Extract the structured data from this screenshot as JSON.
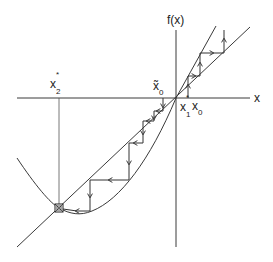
{
  "diagram": {
    "type": "cobweb-plot",
    "colors": {
      "line": "#3a3a3a",
      "background": "#ffffff"
    },
    "axes": {
      "x_label": "x",
      "y_label": "f(x)"
    },
    "labels": {
      "fixed_point_1": {
        "base": "x",
        "sup": "*",
        "sub": "1"
      },
      "fixed_point_2": {
        "base": "x",
        "sup": "*",
        "sub": "2"
      },
      "start_right": {
        "base": "x",
        "sub": "0"
      },
      "start_left": {
        "base": "x̃",
        "sub": "0"
      }
    },
    "curves": [
      {
        "name": "identity-line",
        "label": "y = x"
      },
      {
        "name": "f-curve",
        "label": "f(x)"
      }
    ],
    "cobwebs": [
      {
        "name": "divergent-iteration",
        "start": "x0",
        "direction": "away from x1* upward"
      },
      {
        "name": "convergent-iteration",
        "start": "x̃0",
        "direction": "toward x2*"
      }
    ],
    "markers": [
      {
        "name": "stable-fixed-point-marker",
        "at": "x2*",
        "shape": "boxed-cross"
      }
    ]
  }
}
